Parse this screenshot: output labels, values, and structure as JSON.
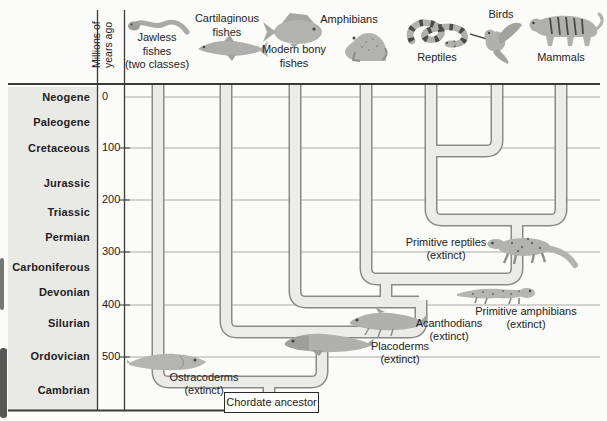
{
  "figure": {
    "axis_label": [
      "Millions of",
      "years ago"
    ],
    "groups": [
      {
        "id": "jawless-fishes",
        "lines": [
          "Jawless",
          "fishes",
          "(two classes)"
        ]
      },
      {
        "id": "cartilaginous-fishes",
        "lines": [
          "Cartilaginous",
          "fishes"
        ]
      },
      {
        "id": "modern-bony-fishes",
        "lines": [
          "Modern bony",
          "fishes"
        ]
      },
      {
        "id": "amphibians",
        "lines": [
          "Amphibians"
        ]
      },
      {
        "id": "reptiles",
        "lines": [
          "Reptiles"
        ]
      },
      {
        "id": "birds",
        "lines": [
          "Birds"
        ]
      },
      {
        "id": "mammals",
        "lines": [
          "Mammals"
        ]
      }
    ],
    "periods": [
      "Neogene",
      "Paleogene",
      "Cretaceous",
      "Jurassic",
      "Triassic",
      "Permian",
      "Carboniferous",
      "Devonian",
      "Silurian",
      "Ordovician",
      "Cambrian"
    ],
    "ticks": [
      "0",
      "100",
      "200",
      "300",
      "400",
      "500"
    ],
    "extinct_branches": [
      {
        "name": "Ostracoderms",
        "status": "(extinct)"
      },
      {
        "name": "Placoderms",
        "status": "(extinct)"
      },
      {
        "name": "Acanthodians",
        "status": "(extinct)"
      },
      {
        "name": "Primitive amphibians",
        "status": "(extinct)"
      },
      {
        "name": "Primitive reptiles",
        "status": "(extinct)"
      }
    ],
    "root": "Chordate ancestor",
    "colors": {
      "branch_fill": "#ebebe8",
      "branch_outline": "#8a8a88",
      "panel_bg": "#e9e9e6",
      "grid": "#aaaaa7",
      "frame": "#3a3a38",
      "text": "#1c1c1c"
    }
  }
}
